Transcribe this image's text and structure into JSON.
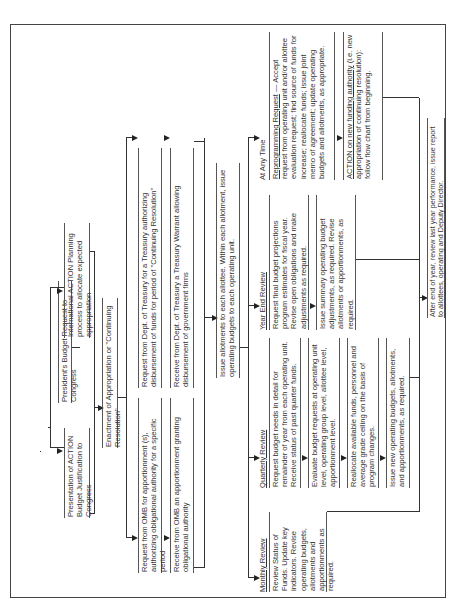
{
  "orientation": "rotated -90 degrees",
  "nodes": {
    "presidents_budget": "President's Budget Request to Congress",
    "action_justification": "Presentation of ACTION Budget Justification to Congress",
    "internal_planning": "International ACTION Planning process to allocate expected appropriation",
    "enactment": "Enactment of Appropriation or \"Continuing Resolution\"",
    "omb_request": "Request from OMB for apportionment (s), authorizing obligational authority for a specific period",
    "omb_receive": "Receive from OMB an apportionment granting obligational authority",
    "treasury_request": "Request from Dept. of Treasury for a Treasury authorizing disbursement of funds for period of \"Continuing Resolution\"",
    "treasury_receive": "Receive from Dept. of Treasury a Treasury Warrant allowing disbursement of government firms",
    "issue_allotments": "Issue allotments to each allottee. Within each allotment, issue operating budgets to each operating unit.",
    "monthly": {
      "heading": "Monthly Review",
      "text": "Review Status of Funds. Update key indicators. Revise operating budgets, allotments and apportionments as required."
    },
    "quarterly": {
      "heading": "Quarterly Review",
      "steps": [
        "Request budget needs in detail for remainder of year from each operating unit. Receive status of past quarter funds.",
        "Evaluate budget requests at operating unit level, operating group level, allottee level, apportionment level.",
        "Reallocate available funds, personnel and average grade ceiling on the basis of program changes.",
        "Issue new operating budgets, allotments, and apportionments, as required."
      ]
    },
    "year_end": {
      "heading": "Year End Review",
      "steps": [
        "Request final budget projections program estimates for fiscal year. Revise open obligations and make adjustments as required.",
        "Issue summary operating budget adjustments, as required. Revise allotments or apportionments, as required."
      ]
    },
    "any_time": {
      "heading": "At Any Time",
      "steps": [
        {
          "lead": "Reprogramming Request",
          "text": " — Accept request from operating unit and/or allottee evaluation request; find source of funds for increase; reallocate funds; issue joint memo of agreement; update operating budgets and allotments, as appropriate."
        },
        {
          "lead": "ACTION on new funding authority",
          "text": " (i.e. new appropriation of continuing resolution): follow flow chart from beginning."
        }
      ]
    },
    "after_year": "After end of year, review last year performance, issue report to allottees, operating and Deputy Director."
  }
}
